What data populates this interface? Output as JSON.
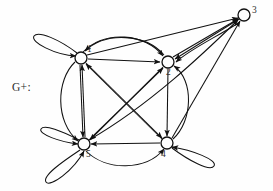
{
  "figure": {
    "caption": "G+:",
    "background_color": "#fefefe",
    "ink_color": "#1a1a1a"
  },
  "graph": {
    "type": "directed-graph",
    "node_count": 5,
    "nodes": [
      {
        "id": "1",
        "label": "1",
        "cx": 81,
        "cy": 58,
        "r": 6.0,
        "label_dx": 6,
        "label_dy": -14
      },
      {
        "id": "2",
        "label": "2",
        "cx": 168,
        "cy": 62,
        "r": 6.0,
        "label_dx": -2,
        "label_dy": 5
      },
      {
        "id": "3",
        "label": "3",
        "cx": 244,
        "cy": 15,
        "r": 6.0,
        "label_dx": 8,
        "label_dy": -10
      },
      {
        "id": "4",
        "label": "4",
        "cx": 167,
        "cy": 143,
        "r": 6.0,
        "label_dx": -6,
        "label_dy": 6
      },
      {
        "id": "5",
        "label": "5",
        "cx": 84,
        "cy": 144,
        "r": 6.0,
        "label_dx": 2,
        "label_dy": 5
      }
    ],
    "self_loops": [
      {
        "node": "1",
        "direction": "upper-left"
      },
      {
        "node": "4",
        "direction": "lower-right"
      },
      {
        "node": "5",
        "direction": "lower-left"
      },
      {
        "node": "5",
        "direction": "upper-left"
      }
    ],
    "edges": [
      {
        "from": "1",
        "to": "2",
        "style": "straight"
      },
      {
        "from": "1",
        "to": "2",
        "style": "curve-above"
      },
      {
        "from": "1",
        "to": "3",
        "style": "straight"
      },
      {
        "from": "1",
        "to": "4",
        "style": "diagonal"
      },
      {
        "from": "1",
        "to": "5",
        "style": "straight-vertical"
      },
      {
        "from": "1",
        "to": "5",
        "style": "curve-left"
      },
      {
        "from": "2",
        "to": "1",
        "style": "curve-above"
      },
      {
        "from": "2",
        "to": "3",
        "style": "straight"
      },
      {
        "from": "2",
        "to": "4",
        "style": "straight-vertical"
      },
      {
        "from": "2",
        "to": "5",
        "style": "diagonal"
      },
      {
        "from": "3",
        "to": "2",
        "style": "straight"
      },
      {
        "from": "4",
        "to": "1",
        "style": "diagonal"
      },
      {
        "from": "4",
        "to": "2",
        "style": "curve-right"
      },
      {
        "from": "4",
        "to": "3",
        "style": "straight"
      },
      {
        "from": "4",
        "to": "5",
        "style": "straight-horizontal"
      },
      {
        "from": "5",
        "to": "1",
        "style": "straight-vertical"
      },
      {
        "from": "5",
        "to": "2",
        "style": "diagonal"
      },
      {
        "from": "5",
        "to": "3",
        "style": "straight"
      },
      {
        "from": "5",
        "to": "4",
        "style": "curve-below"
      }
    ]
  }
}
